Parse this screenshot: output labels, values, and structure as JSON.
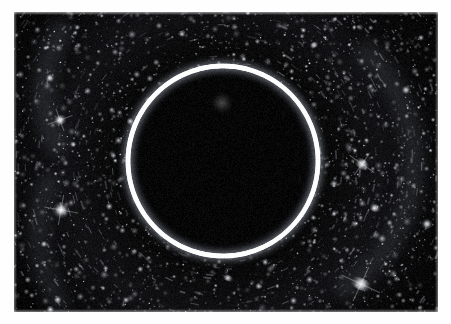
{
  "image": {
    "kind": "astronomical-photograph",
    "subject": "einstein-ring",
    "frame": {
      "x": 14,
      "y": 12,
      "width": 424,
      "height": 300
    },
    "page_background_color": "#fefefe",
    "sky_background_color": "#050505",
    "alt_text": "Dense star field with a bright circular Einstein ring of gravitationally lensed light surrounding a dark central region"
  },
  "ring": {
    "label": "einstein-ring",
    "center_x": 209,
    "center_y": 149,
    "radius": 95,
    "thickness": 4.2,
    "color": "#ffffff",
    "glow_color": "#cfd6e6",
    "interior_color": "#090909",
    "brightness_variation": [
      {
        "angle_deg": 0,
        "intensity": 0.92
      },
      {
        "angle_deg": 45,
        "intensity": 0.8
      },
      {
        "angle_deg": 90,
        "intensity": 1.0
      },
      {
        "angle_deg": 135,
        "intensity": 0.86
      },
      {
        "angle_deg": 180,
        "intensity": 0.95
      },
      {
        "angle_deg": 225,
        "intensity": 0.88
      },
      {
        "angle_deg": 270,
        "intensity": 0.97
      },
      {
        "angle_deg": 315,
        "intensity": 0.78
      }
    ]
  },
  "lensing_galaxy": {
    "label": "central-lensing-blob",
    "center_x": 208,
    "center_y": 91,
    "radius": 11,
    "color": "#6e6e6e",
    "opacity": 0.55
  },
  "starfield": {
    "description": "dense speckled field of faint stars and galaxies with radial streak texture",
    "speck_count": 2600,
    "streak_count": 520,
    "base_color": "#050505",
    "speck_color": "#f2f2f2",
    "seed": 20240719
  },
  "bright_objects": [
    {
      "name": "bright-galaxy-left-upper",
      "x": 46,
      "y": 108,
      "rx": 7,
      "ry": 5,
      "rot": -20,
      "brightness": 0.95
    },
    {
      "name": "bright-star-left-mid",
      "x": 47,
      "y": 198,
      "rx": 9,
      "ry": 8,
      "rot": 10,
      "brightness": 1.0
    },
    {
      "name": "bright-speck-left-lower",
      "x": 30,
      "y": 232,
      "rx": 4,
      "ry": 3,
      "rot": 0,
      "brightness": 0.8
    },
    {
      "name": "bright-star-top-left",
      "x": 36,
      "y": 66,
      "rx": 5,
      "ry": 4,
      "rot": 0,
      "brightness": 0.85
    },
    {
      "name": "bright-galaxy-right-mid",
      "x": 348,
      "y": 152,
      "rx": 8,
      "ry": 5,
      "rot": 35,
      "brightness": 0.92
    },
    {
      "name": "bright-galaxy-right-lower",
      "x": 361,
      "y": 196,
      "rx": 6,
      "ry": 4,
      "rot": 20,
      "brightness": 0.85
    },
    {
      "name": "bright-galaxy-bottom-right",
      "x": 347,
      "y": 272,
      "rx": 11,
      "ry": 6,
      "rot": 25,
      "brightness": 0.95
    },
    {
      "name": "bright-speck-right-edge",
      "x": 413,
      "y": 212,
      "rx": 6,
      "ry": 5,
      "rot": 0,
      "brightness": 0.88
    },
    {
      "name": "bright-speck-top-right",
      "x": 300,
      "y": 33,
      "rx": 5,
      "ry": 3,
      "rot": -30,
      "brightness": 0.82
    },
    {
      "name": "bright-speck-bottom-mid",
      "x": 214,
      "y": 266,
      "rx": 6,
      "ry": 3,
      "rot": 25,
      "brightness": 0.7
    },
    {
      "name": "bright-speck-bottom-left",
      "x": 112,
      "y": 288,
      "rx": 4,
      "ry": 3,
      "rot": 0,
      "brightness": 0.72
    },
    {
      "name": "bright-speck-top-mid",
      "x": 168,
      "y": 22,
      "rx": 4,
      "ry": 3,
      "rot": 0,
      "brightness": 0.75
    },
    {
      "name": "bright-speck-upper-right",
      "x": 392,
      "y": 78,
      "rx": 5,
      "ry": 4,
      "rot": 15,
      "brightness": 0.8
    }
  ],
  "diffuse_arcs": [
    {
      "name": "arc-upper-left",
      "cx": 150,
      "cy": 80,
      "r": 120,
      "from_deg": 150,
      "to_deg": 215,
      "opacity": 0.16
    },
    {
      "name": "arc-lower-left",
      "cx": 160,
      "cy": 220,
      "r": 135,
      "from_deg": 145,
      "to_deg": 205,
      "opacity": 0.13
    },
    {
      "name": "arc-right-sweep",
      "cx": 250,
      "cy": 150,
      "r": 150,
      "from_deg": 310,
      "to_deg": 60,
      "opacity": 0.14
    }
  ]
}
